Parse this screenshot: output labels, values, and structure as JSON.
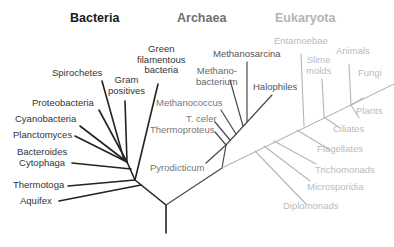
{
  "colors": {
    "bacteria": "#222222",
    "archaea": "#4a4a4a",
    "eukaryota": "#b0b0b0",
    "bacteria_header": "#1a1a1a",
    "archaea_header": "#707070",
    "eukaryota_header": "#b4b4b4"
  },
  "headers": {
    "bacteria": "Bacteria",
    "archaea": "Archaea",
    "eukaryota": "Eukaryota"
  },
  "bacteria": {
    "green_filamentous_1": "Green",
    "green_filamentous_2": "filamentous",
    "green_filamentous_3": "bacteria",
    "spirochetes": "Spirochetes",
    "gram_1": "Gram",
    "gram_2": "positives",
    "proteobacteria": "Proteobacteria",
    "cyanobacteria": "Cyanobacteria",
    "planctomyces": "Planctomyces",
    "bacteroides_1": "Bacteroides",
    "bacteroides_2": "Cytophaga",
    "thermotoga": "Thermotoga",
    "aquifex": "Aquifex"
  },
  "archaea": {
    "methanosarcina": "Methanosarcina",
    "methanobacterium_1": "Methano-",
    "methanobacterium_2": "bacterium",
    "halophiles": "Halophiles",
    "methanococcus": "Methanococcus",
    "t_celer": "T. celer",
    "thermoproteus": "Thermoproteus",
    "pyrodicticum": "Pyrodicticum"
  },
  "eukaryota": {
    "entamoebae": "Entamoebae",
    "slime_1": "Slime",
    "slime_2": "molds",
    "animals": "Animals",
    "fungi": "Fungi",
    "plants": "Plants",
    "ciliates": "Ciliates",
    "flagellates": "Flagellates",
    "trichomonads": "Trichomonads",
    "microsporidia": "Microsporidia",
    "diplomonads": "Diplomonads"
  }
}
